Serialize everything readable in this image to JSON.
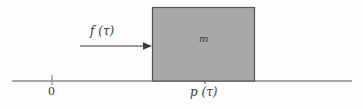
{
  "figure": {
    "type": "mechanics-free-body-diagram",
    "background_color": "#fdfdfd",
    "line_color": "#808080",
    "ink_color": "#3c3c3c"
  },
  "axis": {
    "name": "horizontal-position-axis",
    "x_start": 12,
    "x_end": 352,
    "y": 81,
    "color": "#8a8a8a",
    "thickness": 1.6
  },
  "ticks": [
    {
      "name": "origin-tick",
      "x": 52,
      "label": "0",
      "label_x": 48,
      "label_y": 86
    },
    {
      "name": "position-tick",
      "x": 205,
      "label": "p (τ)",
      "label_x": 190,
      "label_y": 86
    }
  ],
  "block": {
    "name": "mass-block",
    "x": 152,
    "y": 7,
    "width": 103,
    "height": 74,
    "fill": "#a8a8a8",
    "stroke": "#555555",
    "stroke_width": 1.2,
    "label": "m",
    "label_x": 199,
    "label_y": 34
  },
  "force_arrow": {
    "name": "force-arrow",
    "x_start": 80,
    "x_end": 152,
    "y": 46,
    "color": "#3c3c3c",
    "thickness": 1.1,
    "head_length": 9,
    "head_width": 7,
    "label": "f (τ)",
    "label_x": 90,
    "label_y": 25
  },
  "labels": {
    "force": "f (τ)",
    "mass": "m",
    "origin": "0",
    "position": "p (τ)"
  }
}
